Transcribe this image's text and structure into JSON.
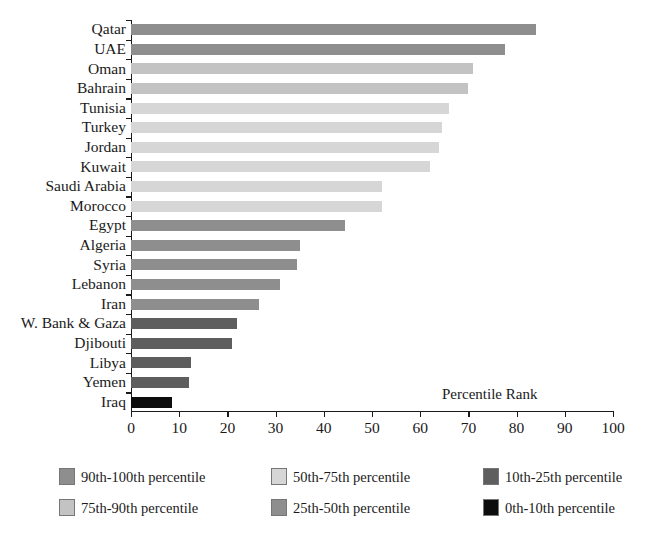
{
  "chart_data": {
    "type": "bar",
    "orientation": "horizontal",
    "title": "",
    "subtitle": "",
    "xlabel": "Percentile Rank",
    "ylabel": "",
    "xlim": [
      0,
      100
    ],
    "ylim": null,
    "grid": false,
    "legend_position": "bottom",
    "annotation": "Percentile Rank",
    "x_ticks": [
      "0",
      "10",
      "20",
      "30",
      "40",
      "50",
      "60",
      "70",
      "80",
      "90",
      "100"
    ],
    "x_tick_values": [
      0,
      10,
      20,
      30,
      40,
      50,
      60,
      70,
      80,
      90,
      100
    ],
    "categories": [
      "Qatar",
      "UAE",
      "Oman",
      "Bahrain",
      "Tunisia",
      "Turkey",
      "Jordan",
      "Kuwait",
      "Saudi Arabia",
      "Morocco",
      "Egypt",
      "Algeria",
      "Syria",
      "Lebanon",
      "Iran",
      "W. Bank & Gaza",
      "Djibouti",
      "Libya",
      "Yemen",
      "Iraq"
    ],
    "values": [
      84,
      77.5,
      71,
      70,
      66,
      64.5,
      64,
      62,
      52,
      52,
      44.5,
      35,
      34.5,
      31,
      26.5,
      22,
      21,
      12.5,
      12,
      8.5
    ],
    "bands": [
      "90th-100th",
      "90th-100th",
      "75th-90th",
      "75th-90th",
      "50th-75th",
      "50th-75th",
      "50th-75th",
      "50th-75th",
      "50th-75th",
      "50th-75th",
      "25th-50th",
      "25th-50th",
      "25th-50th",
      "25th-50th",
      "25th-50th",
      "10th-25th",
      "10th-25th",
      "10th-25th",
      "10th-25th",
      "0th-10th"
    ],
    "band_colors": {
      "90th-100th": "#8e8e8e",
      "75th-90th": "#c3c3c3",
      "50th-75th": "#d6d6d6",
      "25th-50th": "#8e8e8e",
      "10th-25th": "#5e5e5e",
      "0th-10th": "#0d0d0d"
    },
    "legend": [
      {
        "label": "90th-100th percentile",
        "color": "#8e8e8e"
      },
      {
        "label": "50th-75th percentile",
        "color": "#d6d6d6"
      },
      {
        "label": "10th-25th percentile",
        "color": "#5e5e5e"
      },
      {
        "label": "75th-90th percentile",
        "color": "#c3c3c3"
      },
      {
        "label": "25th-50th percentile",
        "color": "#8e8e8e"
      },
      {
        "label": "0th-10th percentile",
        "color": "#0d0d0d"
      }
    ]
  }
}
